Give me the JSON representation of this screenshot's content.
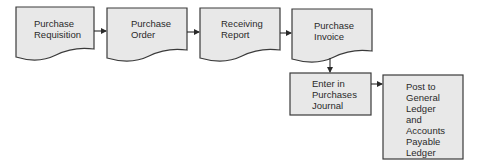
{
  "diagram": {
    "type": "flowchart",
    "colors": {
      "fill": "#e8e8e8",
      "stroke": "#3a3a3a",
      "text": "#2a2a2a",
      "background": "#ffffff"
    },
    "nodes": [
      {
        "id": "n1",
        "shape": "document",
        "label": "Purchase\nRequisition"
      },
      {
        "id": "n2",
        "shape": "document",
        "label": "Purchase\nOrder"
      },
      {
        "id": "n3",
        "shape": "document",
        "label": "Receiving\nReport"
      },
      {
        "id": "n4",
        "shape": "document",
        "label": "Purchase\nInvoice"
      },
      {
        "id": "n5",
        "shape": "process",
        "label": "Enter in\nPurchases\nJournal"
      },
      {
        "id": "n6",
        "shape": "process",
        "label": "Post to\nGeneral\nLedger\nand\nAccounts\nPayable\nLedger"
      }
    ],
    "edges": [
      {
        "from": "n1",
        "to": "n2"
      },
      {
        "from": "n2",
        "to": "n3"
      },
      {
        "from": "n3",
        "to": "n4"
      },
      {
        "from": "n4",
        "to": "n5"
      },
      {
        "from": "n5",
        "to": "n6"
      }
    ]
  }
}
